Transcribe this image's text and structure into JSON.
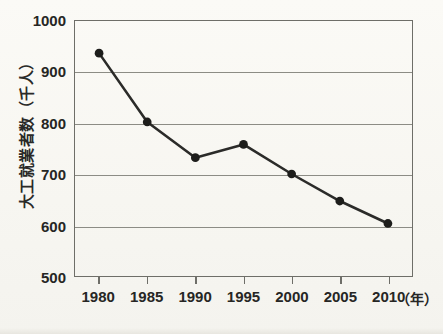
{
  "chart_data": {
    "type": "line",
    "title": "",
    "xlabel": "年",
    "ylabel": "大工就業者数（千人）",
    "categories": [
      "1980",
      "1985",
      "1990",
      "1995",
      "2000",
      "2005",
      "2010"
    ],
    "values": [
      937,
      802,
      732,
      758,
      700,
      647,
      603
    ],
    "series": [
      {
        "name": "大工就業者数",
        "values": [
          937,
          802,
          732,
          758,
          700,
          647,
          603
        ]
      }
    ],
    "xlim": [
      1977.5,
      2012.5
    ],
    "ylim": [
      500,
      1000
    ],
    "y_ticks": [
      "1000",
      "900",
      "800",
      "700",
      "600",
      "500"
    ],
    "y_tick_values": [
      1000,
      900,
      800,
      700,
      600,
      500
    ],
    "grid": true,
    "legend": "none",
    "line_color": "#2b2b29",
    "marker_color": "#1d1d1b",
    "grid_color": "#8c8c85",
    "axis_color": "#6e6e68",
    "background_color": "#faf9f5"
  },
  "axes": {
    "y_title": "大工就業者数（千人）",
    "x_unit": "（年）"
  }
}
